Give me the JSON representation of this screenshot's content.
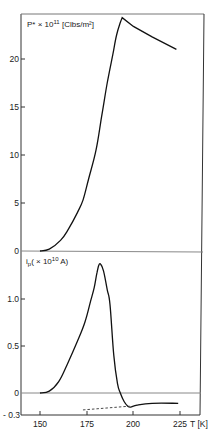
{
  "chart_data": [
    {
      "type": "line",
      "panel": "top",
      "title": "",
      "ylabel": "P* × 10^11 [Clbs/m²]",
      "ylabel_parts": {
        "base": "P* × 10",
        "exp": "11",
        "unit": " [Clbs/m²]"
      },
      "xlabel": "T [K]",
      "xlim": [
        140,
        230
      ],
      "ylim": [
        0,
        25
      ],
      "yticks": [
        0,
        5,
        10,
        15,
        20
      ],
      "ytick_labels": [
        "0",
        "5",
        "10",
        "15",
        "20"
      ],
      "grid": false,
      "series": [
        {
          "name": "P*",
          "style": "solid",
          "x": [
            150,
            155,
            161,
            165,
            170,
            173,
            176,
            180,
            183,
            186,
            189,
            191,
            193,
            194,
            200,
            210,
            223
          ],
          "y": [
            0,
            0.2,
            1.1,
            2.2,
            4.0,
            5.3,
            7.5,
            10.5,
            14.0,
            17.5,
            20.5,
            22.5,
            23.8,
            24.3,
            23.4,
            22.3,
            21.0
          ]
        }
      ]
    },
    {
      "type": "line",
      "panel": "bottom",
      "title": "",
      "ylabel": "i_p ( × 10^10 A)",
      "ylabel_parts": {
        "base": "i",
        "sub": "p",
        "mid": "( × 10",
        "exp": "10",
        "unit": " A)"
      },
      "xlabel": "T [K]",
      "xlim": [
        140,
        230
      ],
      "ylim": [
        -0.3,
        1.5
      ],
      "xticks": [
        150,
        175,
        200,
        225
      ],
      "xtick_labels": [
        "150",
        "175",
        "200",
        "225"
      ],
      "yticks": [
        -0.3,
        0,
        0.5,
        1.0
      ],
      "ytick_labels": [
        "- 0.3",
        "0",
        "0.5",
        "1.0"
      ],
      "grid": false,
      "series": [
        {
          "name": "i_p",
          "style": "solid",
          "x": [
            150,
            155,
            160,
            164.5,
            170,
            174,
            177,
            179,
            180.5,
            181.5,
            182.5,
            184,
            186,
            187.5,
            189.5,
            191.5,
            193,
            195,
            197,
            198.5,
            202,
            210,
            224
          ],
          "y": [
            0,
            0.02,
            0.12,
            0.3,
            0.55,
            0.75,
            0.97,
            1.12,
            1.28,
            1.36,
            1.37,
            1.3,
            1.1,
            0.94,
            0.4,
            0.1,
            0.0,
            -0.09,
            -0.14,
            -0.15,
            -0.13,
            -0.11,
            -0.11
          ]
        },
        {
          "name": "baseline",
          "style": "dashed",
          "x": [
            173,
            198
          ],
          "y": [
            -0.18,
            -0.14
          ]
        }
      ]
    }
  ],
  "x_axis": {
    "tick_labels": [
      "150",
      "175",
      "200",
      "225"
    ],
    "label": "T [K]"
  },
  "top_panel": {
    "y_label_base": "P* × 10",
    "y_label_exp": "11",
    "y_label_unit": " [Clbs/m²]",
    "y_ticks": [
      "20",
      "15",
      "10",
      "5",
      "0"
    ]
  },
  "bottom_panel": {
    "y_label_i": "i",
    "y_label_sub": "p",
    "y_label_mid": "( × 10",
    "y_label_exp": "10",
    "y_label_unit": " A)",
    "y_ticks": [
      "1.0",
      "0.5",
      "0",
      "- 0.3"
    ]
  }
}
